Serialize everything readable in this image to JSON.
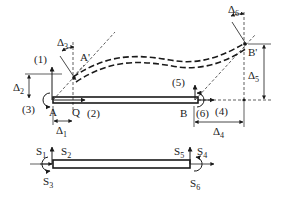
{
  "diagram": {
    "title": "",
    "type": "beam-element-degrees-of-freedom",
    "colors": {
      "ink": "#1a1a1a",
      "background": "#ffffff"
    },
    "upper_figure": {
      "nodes": {
        "A": "A",
        "Q": "Q",
        "B": "B",
        "A_prime": "A'",
        "B_prime": "B'"
      },
      "dof_labels": {
        "d1": "(1)",
        "d2": "(2)",
        "d3": "(3)",
        "d4": "(4)",
        "d5": "(5)",
        "d6": "(6)"
      },
      "displacements": {
        "delta": "Δ",
        "delta1_sub": "1",
        "delta2_sub": "2",
        "delta3_sub": "3",
        "delta4_sub": "4",
        "delta5_sub": "5",
        "delta6_sub": "6"
      }
    },
    "lower_figure": {
      "forces": {
        "S": "S",
        "s1_sub": "1",
        "s2_sub": "2",
        "s3_sub": "3",
        "s4_sub": "4",
        "s5_sub": "5",
        "s6_sub": "6"
      }
    }
  }
}
